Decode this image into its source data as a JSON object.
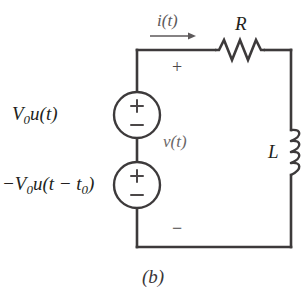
{
  "figure": {
    "caption": "(b)",
    "background_color": "#ffffff",
    "line_color": "#3d3a3b",
    "label_color": "#231f20",
    "faint_label_color": "#6b6768"
  },
  "circuit": {
    "type": "series RL circuit with two step voltage sources",
    "loop": {
      "left_x": 137,
      "right_x": 291,
      "top_y": 50,
      "bottom_y": 247
    },
    "elements": [
      {
        "name": "voltage-source-top",
        "kind": "independent-voltage-source",
        "label": "V₀u(t)",
        "label_base": "V",
        "label_sub": "0",
        "label_rest": "u(t)",
        "terminal_plus": "+",
        "terminal_minus": "−",
        "center": [
          137,
          115
        ],
        "radius": 23
      },
      {
        "name": "voltage-source-bottom",
        "kind": "independent-voltage-source",
        "label": "−V₀u(t − t₀)",
        "label_prefix": "−V",
        "label_sub1": "0",
        "label_mid": "u(t − t",
        "label_sub2": "0",
        "label_suffix": ")",
        "terminal_plus": "+",
        "terminal_minus": "−",
        "center": [
          137,
          185
        ],
        "radius": 23
      },
      {
        "name": "resistor",
        "kind": "resistor",
        "label": "R",
        "span_x": [
          215,
          265
        ],
        "y": 50,
        "zigzags": 3
      },
      {
        "name": "inductor",
        "kind": "inductor",
        "label": "L",
        "span_y": [
          130,
          175
        ],
        "x": 291,
        "loops": 4
      }
    ],
    "annotations": [
      {
        "name": "current-label",
        "text": "i(t)",
        "arrow_direction": "right",
        "arrow_from": [
          150,
          36
        ],
        "arrow_to": [
          196,
          36
        ]
      },
      {
        "name": "voltage-label",
        "text": "v(t)"
      },
      {
        "name": "polarity-plus",
        "text": "+"
      },
      {
        "name": "polarity-minus",
        "text": "−"
      }
    ]
  }
}
